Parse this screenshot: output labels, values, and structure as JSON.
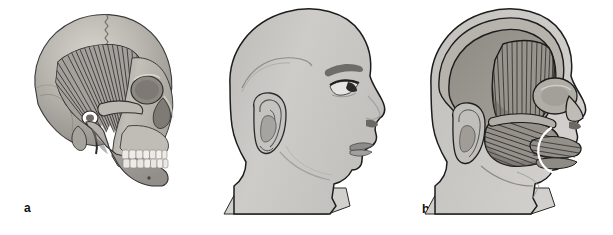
{
  "figure": {
    "background_color": "#ffffff",
    "width": 613,
    "height": 235,
    "panel_count": 3
  },
  "panels": [
    {
      "id": "a",
      "label": "a",
      "subject": "lateral-skull-with-temporalis-muscle",
      "description": "Lateral view of the skull showing the fan-shaped temporalis muscle filling the temporal fossa",
      "structures": [
        "cranial-vault",
        "coronal-suture",
        "temporalis-muscle",
        "temporal-line",
        "zygomatic-arch",
        "orbit",
        "nasal-aperture",
        "maxilla",
        "mandible",
        "teeth",
        "external-acoustic-meatus",
        "mastoid-process",
        "coronoid-process",
        "mental-foramen"
      ],
      "colors": {
        "bone": "#aeaaa4",
        "bone_light": "#cac6c0",
        "bone_shadow": "#8e8a85",
        "muscle": "#a5a19b",
        "striation": "#2a2a2a",
        "outline": "#2b2b2b",
        "tooth": "#ececea"
      }
    },
    {
      "id": "b",
      "label": "b",
      "subject": "lateral-head-surface-profile",
      "description": "Lateral surface profile of the head and neck with intact skin",
      "structures": [
        "scalp",
        "forehead",
        "eyebrow",
        "eye",
        "eyelashes",
        "nose",
        "lips",
        "chin",
        "ear",
        "helix",
        "antihelix",
        "concha",
        "earlobe",
        "temporal-line-contour",
        "mandibular-contour",
        "neck",
        "shoulder-cut"
      ],
      "colors": {
        "skin": "#c9c7c4",
        "skin_shadow": "#b3b1ae",
        "skin_highlight": "#d8d6d3",
        "outline": "#1d1d1d",
        "feature_dark": "#5f5d5a"
      }
    },
    {
      "id": "c",
      "label": "c",
      "subject": "lateral-head-with-masticatory-muscles",
      "description": "Lateral view of the head with the skin removed showing the temporalis and masseter muscles beneath the scalp layers, with a white marker line over the perioral region",
      "structures": [
        "scalp-layer",
        "temporal-fascia",
        "temporalis-muscle",
        "masseter-muscle",
        "zygomatic-arch",
        "orbicularis-oculi",
        "orbicularis-oris",
        "buccinator",
        "nose",
        "ear",
        "neck",
        "shoulder-cut",
        "white-marker-line"
      ],
      "colors": {
        "scalp": "#c9c7c4",
        "fascia": "#9c9892",
        "deep_tissue": "#8a8680",
        "muscle": "#98948e",
        "striation": "#242424",
        "outline": "#1d1d1d",
        "marker": "#ffffff"
      }
    }
  ]
}
